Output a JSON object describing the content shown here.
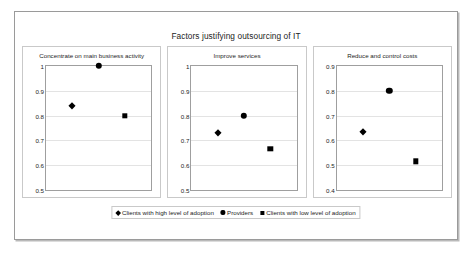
{
  "chart_data": {
    "type": "scatter",
    "title": "Factors justifying outsourcing of IT",
    "xlabel": "",
    "ylabel": "",
    "grid": true,
    "legend_position": "bottom",
    "legend": [
      {
        "name": "Clients with high level of adoption",
        "marker": "diamond",
        "color": "#000000"
      },
      {
        "name": "Providers",
        "marker": "circle",
        "color": "#000000"
      },
      {
        "name": "Clients with low level of adoption",
        "marker": "square",
        "color": "#000000"
      }
    ],
    "panels": [
      {
        "title": "Concentrate on main business activity",
        "ylim": [
          0.5,
          1.0
        ],
        "yticks": [
          "0.5",
          "0.6",
          "0.7",
          "0.8",
          "0.9",
          "1"
        ],
        "ytick_values": [
          0.5,
          0.6,
          0.7,
          0.8,
          0.9,
          1.0
        ],
        "points": [
          {
            "series": "Clients with high level of adoption",
            "marker": "diamond",
            "x": 0.25,
            "value": 0.84
          },
          {
            "series": "Providers",
            "marker": "circle",
            "x": 0.5,
            "value": 1.0
          },
          {
            "series": "Clients with low level of adoption",
            "marker": "square",
            "x": 0.75,
            "value": 0.8
          }
        ]
      },
      {
        "title": "Improve services",
        "ylim": [
          0.5,
          1.0
        ],
        "yticks": [
          "0.5",
          "0.6",
          "0.7",
          "0.8",
          "0.9",
          "1"
        ],
        "ytick_values": [
          0.5,
          0.6,
          0.7,
          0.8,
          0.9,
          1.0
        ],
        "points": [
          {
            "series": "Clients with high level of adoption",
            "marker": "diamond",
            "x": 0.25,
            "value": 0.73
          },
          {
            "series": "Providers",
            "marker": "circle",
            "x": 0.5,
            "value": 0.8
          },
          {
            "series": "Clients with low level of adoption",
            "marker": "square",
            "x": 0.75,
            "value": 0.665
          }
        ]
      },
      {
        "title": "Reduce and control costs",
        "ylim": [
          0.4,
          0.9
        ],
        "yticks": [
          "0.4",
          "0.5",
          "0.6",
          "0.7",
          "0.8",
          "0.9"
        ],
        "ytick_values": [
          0.4,
          0.5,
          0.6,
          0.7,
          0.8,
          0.9
        ],
        "points": [
          {
            "series": "Clients with high level of adoption",
            "marker": "diamond",
            "x": 0.25,
            "value": 0.635
          },
          {
            "series": "Providers",
            "marker": "circle",
            "x": 0.5,
            "value": 0.8
          },
          {
            "series": "Clients with low level of adoption",
            "marker": "square",
            "x": 0.75,
            "value": 0.515
          }
        ]
      }
    ]
  }
}
